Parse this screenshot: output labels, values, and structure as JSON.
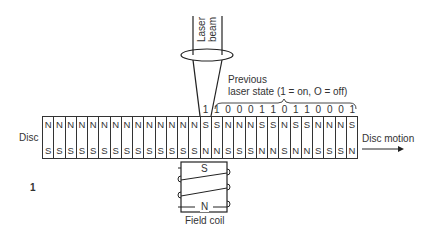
{
  "labels": {
    "laser_beam_line1": "Laser",
    "laser_beam_line2": "beam",
    "previous_line1": "Previous",
    "previous_line2": "laser state (1 = on, O = off)",
    "disc": "Disc",
    "disc_motion": "Disc motion",
    "field_coil": "Field coil",
    "figure_number": "1",
    "coil_top_pole": "S",
    "coil_bottom_pole": "N"
  },
  "disc_cells": {
    "top": [
      "N",
      "N",
      "N",
      "N",
      "N",
      "N",
      "N",
      "N",
      "N",
      "N",
      "N",
      "N",
      "N",
      "N",
      "S",
      "S",
      "N",
      "N",
      "N",
      "S",
      "S",
      "N",
      "S",
      "S",
      "N",
      "N",
      "N",
      "S"
    ],
    "bottom": [
      "S",
      "S",
      "S",
      "S",
      "S",
      "S",
      "S",
      "S",
      "S",
      "S",
      "S",
      "S",
      "S",
      "S",
      "N",
      "N",
      "S",
      "S",
      "S",
      "N",
      "N",
      "S",
      "N",
      "N",
      "S",
      "S",
      "S",
      "N"
    ]
  },
  "bits": [
    "",
    "",
    "",
    "",
    "",
    "",
    "",
    "",
    "",
    "",
    "",
    "",
    "",
    "",
    "1",
    "1",
    "0",
    "0",
    "0",
    "1",
    "1",
    "0",
    "1",
    "1",
    "0",
    "0",
    "0",
    "1"
  ]
}
